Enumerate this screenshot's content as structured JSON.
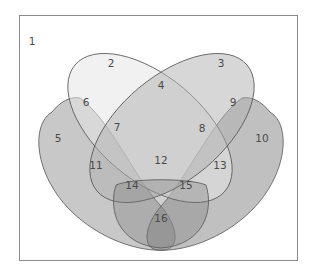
{
  "diagram": {
    "type": "venn",
    "sets": 4,
    "regions": [
      {
        "id": "1",
        "x": 32,
        "y": 42
      },
      {
        "id": "2",
        "x": 111,
        "y": 64
      },
      {
        "id": "3",
        "x": 221,
        "y": 64
      },
      {
        "id": "4",
        "x": 161,
        "y": 86
      },
      {
        "id": "5",
        "x": 58,
        "y": 139
      },
      {
        "id": "6",
        "x": 86,
        "y": 103
      },
      {
        "id": "7",
        "x": 117,
        "y": 128
      },
      {
        "id": "8",
        "x": 202,
        "y": 129
      },
      {
        "id": "9",
        "x": 233,
        "y": 103
      },
      {
        "id": "10",
        "x": 262,
        "y": 139
      },
      {
        "id": "11",
        "x": 96,
        "y": 166
      },
      {
        "id": "12",
        "x": 161,
        "y": 161
      },
      {
        "id": "13",
        "x": 220,
        "y": 166
      },
      {
        "id": "14",
        "x": 132,
        "y": 186
      },
      {
        "id": "15",
        "x": 186,
        "y": 186
      },
      {
        "id": "16",
        "x": 161,
        "y": 219
      }
    ],
    "colors": {
      "frame": "#8a8a8a",
      "outline": "#555555",
      "setA_fill": "#d9d9d9",
      "setB_fill": "#a9a9a9",
      "setC_fill": "#9a9a9a",
      "setD_fill": "#8c8c8c",
      "label": "#4a4a4a"
    }
  }
}
